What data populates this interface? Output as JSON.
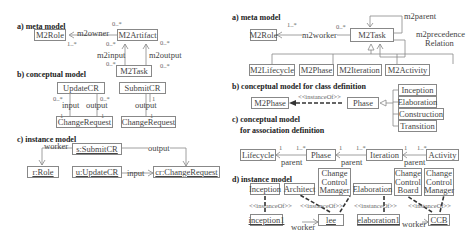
{
  "left": {
    "a": {
      "title": "a) meta model",
      "classes": {
        "role": "M2Role",
        "artifact": "M2Artifact",
        "task": "M2Task"
      },
      "associations": {
        "owner": "m2owner",
        "input": "m2input",
        "output": "m2output"
      },
      "multiplicities": {
        "owner_artifact_end": "0..*",
        "owner_role_end": "1..*",
        "input_artifact_end": "0..*",
        "input_task_end": "0..*",
        "output_artifact_end": "0..*",
        "output_task_end": "0..*"
      }
    },
    "b": {
      "title": "b) conceptual model",
      "classes": {
        "update": "UpdateCR",
        "submit": "SubmitCR",
        "cr1": "ChangeRequest",
        "cr2": "ChangeRequest"
      },
      "labels": {
        "input": "input",
        "output1": "output",
        "output2": "output"
      },
      "multiplicities": {
        "m1": "0..*",
        "m2": "0..*",
        "m3": "1",
        "m4": "1",
        "m5": "1",
        "m6": "1"
      }
    },
    "c": {
      "title": "c) instance model",
      "objects": {
        "submit": "s:SubmitCR",
        "role": "r:Role",
        "update": "u:UpdateCR",
        "cr": "cr:ChangeRequest"
      },
      "links": {
        "worker": "worker",
        "output": "output",
        "input": "input"
      }
    }
  },
  "right": {
    "a": {
      "title": "a) meta model",
      "classes": {
        "role": "M2Role",
        "task": "M2Task",
        "lifecycle": "M2Lifecycle",
        "phase": "M2Phase",
        "iteration": "M2Iteration",
        "activity": "M2Activity"
      },
      "associations": {
        "worker": "m2worker",
        "parent": "m2parent",
        "precedence1": "m2precedence",
        "precedence2": "Relation"
      },
      "multiplicities": {
        "role_end": "1..*",
        "task_end": "0..*"
      }
    },
    "b": {
      "title": "b) conceptual model for class definition",
      "classes": {
        "m2phase": "M2Phase",
        "phase": "Phase"
      },
      "stereotype": "<<instanceOf>>",
      "subclasses": [
        "Inception",
        "Elaboration",
        "Construction",
        "Transition"
      ]
    },
    "c": {
      "title1": "c) conceptual model",
      "title2": "for association  definition",
      "classes": {
        "lifecycle": "Lifecycle",
        "phase": "Phase",
        "iteration": "Iteration",
        "activity": "Activity"
      },
      "assoc": "parent",
      "mult_one": "1",
      "mult_many": "1..*"
    },
    "d": {
      "title": "d) instance model",
      "classes": {
        "inception": "Inception",
        "architect": "Architect",
        "ccm1": "Change Control Manager",
        "elaboration": "Elaboration",
        "ccb": "Change Control Board",
        "ccm2": "Change Control Manager"
      },
      "objects": {
        "inception1": "inception1",
        "lee": "lee",
        "elaboration1": "elaboration1",
        "ccb": "CCB"
      },
      "stereotype": "<<instanceOf>>",
      "worker": "worker"
    }
  }
}
